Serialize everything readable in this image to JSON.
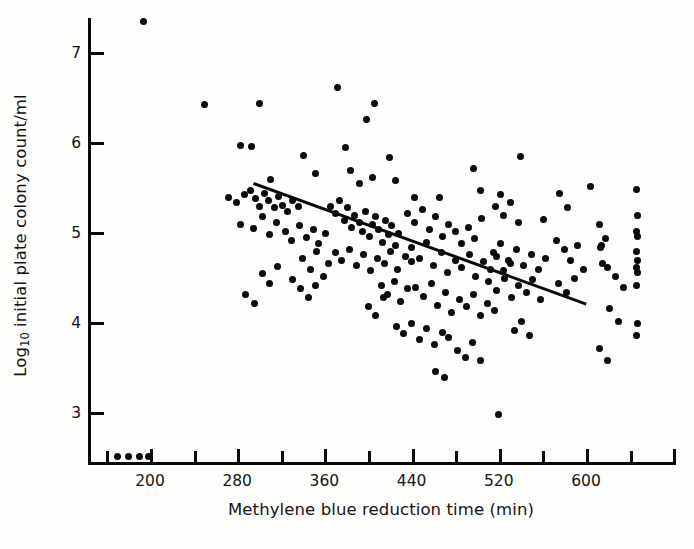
{
  "figure": {
    "background_color": "#fdfdfb",
    "ink_color": "#0a0a0a"
  },
  "chart_data": {
    "type": "scatter",
    "title": "",
    "xlabel": "Methylene blue reduction time (min)",
    "ylabel": "Log10 initial plate colony count/ml",
    "ylabel_base": "Log",
    "ylabel_sub": "10",
    "ylabel_rest": " initial plate colony count/ml",
    "xlim": [
      160,
      660
    ],
    "ylim": [
      2.45,
      7.6
    ],
    "grid": false,
    "legend": "none",
    "xticks": [
      200,
      280,
      360,
      440,
      520,
      600
    ],
    "xticklabels": [
      "200",
      "280",
      "360",
      "440",
      "520",
      "600"
    ],
    "xticks_minor": [
      160,
      240,
      320,
      400,
      480,
      560,
      640
    ],
    "yticks": [
      3,
      4,
      5,
      6,
      7
    ],
    "yticklabels": [
      "3",
      "4",
      "5",
      "6",
      "7"
    ],
    "series": [
      {
        "name": "samples",
        "marker": "filled-circle",
        "color": "#0a0a0a",
        "points": [
          [
            194,
            7.35
          ],
          [
            250,
            6.43
          ],
          [
            300,
            6.44
          ],
          [
            283,
            5.97
          ],
          [
            293,
            5.96
          ],
          [
            372,
            6.62
          ],
          [
            399,
            6.26
          ],
          [
            406,
            6.44
          ],
          [
            341,
            5.86
          ],
          [
            379,
            5.95
          ],
          [
            420,
            5.84
          ],
          [
            497,
            5.72
          ],
          [
            540,
            5.85
          ],
          [
            311,
            5.6
          ],
          [
            352,
            5.66
          ],
          [
            384,
            5.7
          ],
          [
            392,
            5.55
          ],
          [
            404,
            5.62
          ],
          [
            425,
            5.58
          ],
          [
            443,
            5.4
          ],
          [
            466,
            5.39
          ],
          [
            503,
            5.47
          ],
          [
            522,
            5.43
          ],
          [
            561,
            5.15
          ],
          [
            272,
            5.4
          ],
          [
            279,
            5.34
          ],
          [
            287,
            5.43
          ],
          [
            292,
            5.47
          ],
          [
            297,
            5.38
          ],
          [
            300,
            5.3
          ],
          [
            305,
            5.44
          ],
          [
            309,
            5.36
          ],
          [
            314,
            5.28
          ],
          [
            318,
            5.41
          ],
          [
            322,
            5.31
          ],
          [
            326,
            5.24
          ],
          [
            331,
            5.36
          ],
          [
            336,
            5.29
          ],
          [
            283,
            5.1
          ],
          [
            295,
            5.05
          ],
          [
            303,
            5.18
          ],
          [
            310,
            4.98
          ],
          [
            316,
            5.12
          ],
          [
            324,
            5.02
          ],
          [
            330,
            4.92
          ],
          [
            337,
            5.08
          ],
          [
            344,
            4.95
          ],
          [
            350,
            5.04
          ],
          [
            355,
            4.88
          ],
          [
            361,
            5.0
          ],
          [
            366,
            5.3
          ],
          [
            370,
            5.22
          ],
          [
            374,
            5.36
          ],
          [
            378,
            5.14
          ],
          [
            381,
            5.28
          ],
          [
            385,
            5.06
          ],
          [
            388,
            5.2
          ],
          [
            392,
            5.12
          ],
          [
            395,
            5.02
          ],
          [
            398,
            5.24
          ],
          [
            401,
            4.96
          ],
          [
            404,
            5.1
          ],
          [
            407,
            5.18
          ],
          [
            410,
            5.04
          ],
          [
            413,
            4.9
          ],
          [
            416,
            5.14
          ],
          [
            419,
            4.98
          ],
          [
            422,
            5.08
          ],
          [
            425,
            4.86
          ],
          [
            428,
            5.0
          ],
          [
            370,
            4.78
          ],
          [
            376,
            4.7
          ],
          [
            383,
            4.82
          ],
          [
            389,
            4.64
          ],
          [
            396,
            4.76
          ],
          [
            402,
            4.58
          ],
          [
            409,
            4.72
          ],
          [
            415,
            4.66
          ],
          [
            421,
            4.8
          ],
          [
            427,
            4.6
          ],
          [
            434,
            4.74
          ],
          [
            440,
            4.68
          ],
          [
            340,
            4.72
          ],
          [
            347,
            4.6
          ],
          [
            353,
            4.8
          ],
          [
            359,
            4.52
          ],
          [
            364,
            4.66
          ],
          [
            331,
            4.48
          ],
          [
            338,
            4.38
          ],
          [
            345,
            4.28
          ],
          [
            352,
            4.42
          ],
          [
            303,
            4.55
          ],
          [
            310,
            4.44
          ],
          [
            317,
            4.63
          ],
          [
            288,
            4.32
          ],
          [
            296,
            4.22
          ],
          [
            436,
            5.22
          ],
          [
            443,
            5.12
          ],
          [
            450,
            5.26
          ],
          [
            456,
            5.04
          ],
          [
            462,
            5.18
          ],
          [
            468,
            4.96
          ],
          [
            474,
            5.1
          ],
          [
            480,
            5.02
          ],
          [
            486,
            4.88
          ],
          [
            492,
            5.06
          ],
          [
            498,
            4.94
          ],
          [
            504,
            5.16
          ],
          [
            440,
            4.84
          ],
          [
            447,
            4.72
          ],
          [
            454,
            4.9
          ],
          [
            460,
            4.64
          ],
          [
            467,
            4.78
          ],
          [
            473,
            4.56
          ],
          [
            480,
            4.7
          ],
          [
            486,
            4.62
          ],
          [
            493,
            4.76
          ],
          [
            499,
            4.52
          ],
          [
            506,
            4.68
          ],
          [
            512,
            4.6
          ],
          [
            518,
            4.74
          ],
          [
            524,
            4.58
          ],
          [
            531,
            4.66
          ],
          [
            444,
            4.4
          ],
          [
            451,
            4.3
          ],
          [
            458,
            4.44
          ],
          [
            464,
            4.2
          ],
          [
            471,
            4.34
          ],
          [
            477,
            4.12
          ],
          [
            484,
            4.26
          ],
          [
            490,
            4.18
          ],
          [
            497,
            4.32
          ],
          [
            503,
            4.08
          ],
          [
            510,
            4.22
          ],
          [
            516,
            4.14
          ],
          [
            412,
            4.42
          ],
          [
            418,
            4.32
          ],
          [
            424,
            4.46
          ],
          [
            430,
            4.24
          ],
          [
            436,
            4.38
          ],
          [
            400,
            4.18
          ],
          [
            407,
            4.08
          ],
          [
            414,
            4.28
          ],
          [
            426,
            3.96
          ],
          [
            433,
            3.88
          ],
          [
            440,
            4.0
          ],
          [
            447,
            3.82
          ],
          [
            454,
            3.94
          ],
          [
            461,
            3.76
          ],
          [
            468,
            3.9
          ],
          [
            474,
            3.84
          ],
          [
            482,
            3.7
          ],
          [
            489,
            3.62
          ],
          [
            496,
            3.78
          ],
          [
            503,
            3.58
          ],
          [
            462,
            3.46
          ],
          [
            470,
            3.4
          ],
          [
            511,
            4.46
          ],
          [
            518,
            4.36
          ],
          [
            525,
            4.5
          ],
          [
            532,
            4.28
          ],
          [
            538,
            4.42
          ],
          [
            545,
            4.34
          ],
          [
            551,
            4.48
          ],
          [
            558,
            4.26
          ],
          [
            515,
            4.78
          ],
          [
            522,
            4.88
          ],
          [
            529,
            4.7
          ],
          [
            536,
            4.82
          ],
          [
            543,
            4.64
          ],
          [
            550,
            4.76
          ],
          [
            556,
            4.6
          ],
          [
            563,
            4.72
          ],
          [
            517,
            5.3
          ],
          [
            524,
            5.2
          ],
          [
            531,
            5.34
          ],
          [
            538,
            5.12
          ],
          [
            534,
            3.92
          ],
          [
            541,
            4.02
          ],
          [
            548,
            3.86
          ],
          [
            520,
            2.98
          ],
          [
            573,
            4.92
          ],
          [
            580,
            4.82
          ],
          [
            586,
            4.7
          ],
          [
            592,
            4.86
          ],
          [
            598,
            4.6
          ],
          [
            575,
            4.44
          ],
          [
            582,
            4.34
          ],
          [
            589,
            4.5
          ],
          [
            576,
            5.44
          ],
          [
            583,
            5.28
          ],
          [
            604,
            5.52
          ],
          [
            612,
            5.1
          ],
          [
            618,
            4.94
          ],
          [
            613,
            4.84
          ],
          [
            620,
            4.62
          ],
          [
            627,
            4.52
          ],
          [
            634,
            4.4
          ],
          [
            622,
            4.16
          ],
          [
            630,
            4.02
          ],
          [
            612,
            3.72
          ],
          [
            620,
            3.58
          ],
          [
            646,
            5.48
          ],
          [
            647,
            5.2
          ],
          [
            646,
            5.02
          ],
          [
            647,
            4.96
          ],
          [
            646,
            4.8
          ],
          [
            647,
            4.7
          ],
          [
            646,
            4.62
          ],
          [
            647,
            4.56
          ],
          [
            646,
            4.42
          ],
          [
            647,
            4.0
          ],
          [
            646,
            3.86
          ],
          [
            614,
            4.86
          ],
          [
            615,
            4.66
          ],
          [
            170,
            2.52
          ],
          [
            180,
            2.52
          ],
          [
            190,
            2.52
          ],
          [
            199,
            2.52
          ]
        ]
      }
    ],
    "regression_line": {
      "name": "fitted regression line",
      "color": "#0a0a0a",
      "x_start": 295,
      "y_start": 5.57,
      "x_end": 600,
      "y_end": 4.23
    }
  }
}
